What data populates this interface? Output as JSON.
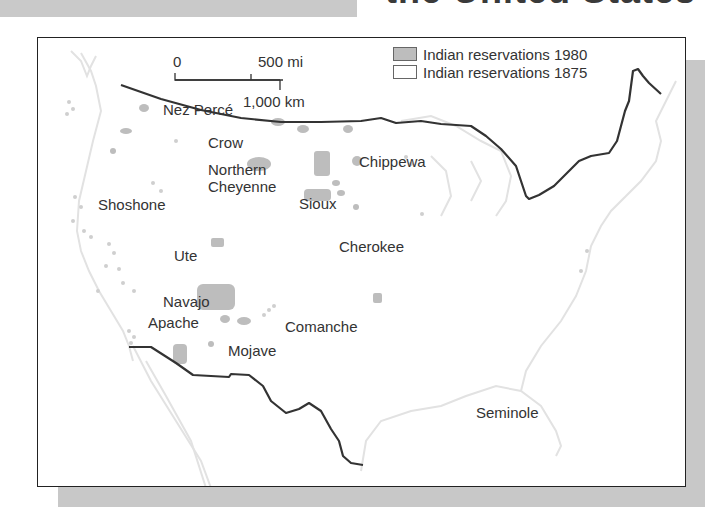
{
  "page": {
    "title_clipped": "the United States"
  },
  "legend": {
    "items": [
      {
        "label": "Indian reservations 1980",
        "color": "#bdbdbd"
      },
      {
        "label": "Indian reservations 1875",
        "color": "#ffffff"
      }
    ]
  },
  "scale": {
    "zero": "0",
    "mi": "500 mi",
    "km": "1,000 km"
  },
  "tribes": [
    {
      "name": "Nez Percé",
      "x": 162,
      "y": 108
    },
    {
      "name": "Crow",
      "x": 207,
      "y": 141
    },
    {
      "name": "Northern",
      "x": 207,
      "y": 168
    },
    {
      "name": "Cheyenne",
      "x": 207,
      "y": 185
    },
    {
      "name": "Sioux",
      "x": 298,
      "y": 202
    },
    {
      "name": "Chippewa",
      "x": 358,
      "y": 160
    },
    {
      "name": "Shoshone",
      "x": 97,
      "y": 203
    },
    {
      "name": "Cherokee",
      "x": 338,
      "y": 245
    },
    {
      "name": "Ute",
      "x": 173,
      "y": 254
    },
    {
      "name": "Navajo",
      "x": 162,
      "y": 300
    },
    {
      "name": "Apache",
      "x": 147,
      "y": 321
    },
    {
      "name": "Comanche",
      "x": 284,
      "y": 325
    },
    {
      "name": "Mojave",
      "x": 227,
      "y": 349
    },
    {
      "name": "Seminole",
      "x": 475,
      "y": 411
    }
  ],
  "colors": {
    "border_line": "#333333",
    "coast": "#e3e3e3",
    "reservation_fill": "#bdbdbd",
    "shadow": "#c8c8c8"
  }
}
